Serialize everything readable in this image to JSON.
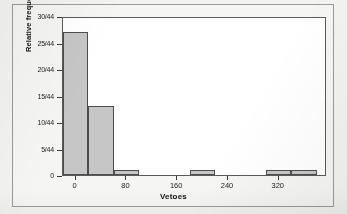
{
  "chart_data": {
    "type": "bar",
    "title": "",
    "subtitle": "",
    "xlabel": "Vetoes",
    "ylabel": "Relative frequency",
    "grid": false,
    "legend": "none",
    "bin_width": 40,
    "denominator": 44,
    "xlim": [
      -20,
      396
    ],
    "ylim": [
      0,
      30
    ],
    "x_ticks": [
      {
        "value": 0,
        "label": "0"
      },
      {
        "value": 80,
        "label": "80"
      },
      {
        "value": 160,
        "label": "160"
      },
      {
        "value": 240,
        "label": "240"
      },
      {
        "value": 320,
        "label": "320"
      }
    ],
    "y_ticks": [
      {
        "value": 0,
        "label": "0"
      },
      {
        "value": 5,
        "label": "5/44"
      },
      {
        "value": 10,
        "label": "10/44"
      },
      {
        "value": 15,
        "label": "15/44"
      },
      {
        "value": 20,
        "label": "20/44"
      },
      {
        "value": 25,
        "label": "25/44"
      },
      {
        "value": 30,
        "label": "30/44"
      }
    ],
    "bars": [
      {
        "bin_start": -20,
        "bin_end": 20,
        "count": 27,
        "label": "27/44"
      },
      {
        "bin_start": 20,
        "bin_end": 60,
        "count": 13,
        "label": "13/44"
      },
      {
        "bin_start": 60,
        "bin_end": 100,
        "count": 1,
        "label": "1/44"
      },
      {
        "bin_start": 180,
        "bin_end": 220,
        "count": 1,
        "label": "1/44"
      },
      {
        "bin_start": 300,
        "bin_end": 340,
        "count": 1,
        "label": "1/44"
      },
      {
        "bin_start": 340,
        "bin_end": 380,
        "count": 1,
        "label": "1/44"
      }
    ],
    "colors": {
      "bar_fill": "#c6c6c6",
      "bar_edge": "#4d4d4d",
      "axis": "#3a3a3a",
      "plot_background": "#ffffff",
      "figure_background": "#f3f3f2",
      "text": "#1d1d1d"
    }
  }
}
